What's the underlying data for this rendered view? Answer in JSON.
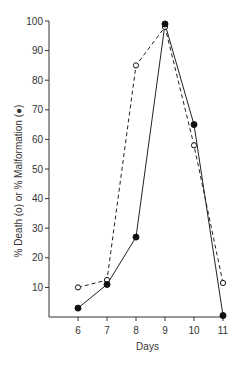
{
  "chart_data": {
    "type": "line",
    "title": "",
    "xlabel": "Days",
    "ylabel": "% Death (o) or % Malformation (●)",
    "x": [
      6,
      7,
      8,
      9,
      10,
      11
    ],
    "x_tick_labels": [
      "6",
      "7",
      "8",
      "9",
      "10",
      "11"
    ],
    "y_tick_labels": [
      "10",
      "20",
      "30",
      "40",
      "50",
      "60",
      "70",
      "80",
      "90",
      "100"
    ],
    "ylim": [
      0,
      100
    ],
    "xlim": [
      5,
      11
    ],
    "grid": false,
    "legend": "none (markers explained in y-axis label)",
    "series": [
      {
        "name": "% Death",
        "marker": "open-circle",
        "line": "dashed",
        "values": [
          10,
          12.5,
          85,
          98,
          58,
          11.5
        ]
      },
      {
        "name": "% Malformation",
        "marker": "filled-circle",
        "line": "solid",
        "values": [
          3,
          11,
          27,
          99,
          65,
          0.5
        ]
      }
    ]
  },
  "labels": {
    "xlabel": "Days",
    "ylabel": "% Death (o) or % Malformation (●)"
  }
}
